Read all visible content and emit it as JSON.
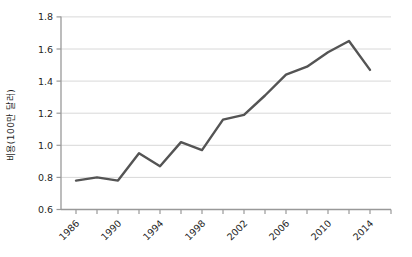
{
  "figure": {
    "background": "#ffffff"
  },
  "chart_data": {
    "type": "line",
    "title": "",
    "xlabel": "",
    "ylabel": "비용(100만 달러)",
    "x": [
      1986,
      1988,
      1990,
      1992,
      1994,
      1996,
      1998,
      2000,
      2002,
      2004,
      2006,
      2008,
      2010,
      2012,
      2014
    ],
    "values": [
      0.78,
      0.8,
      0.78,
      0.95,
      0.87,
      1.02,
      0.97,
      1.16,
      1.19,
      1.31,
      1.44,
      1.49,
      1.58,
      1.65,
      1.47
    ],
    "ylim": [
      0.6,
      1.8
    ],
    "ytick_values": [
      0.6,
      0.8,
      1.0,
      1.2,
      1.4,
      1.6,
      1.8
    ],
    "ytick_labels": [
      "0.6",
      "0.8",
      "1.0",
      "1.2",
      "1.4",
      "1.6",
      "1.8"
    ],
    "xtick_minor_years": [
      1986,
      1988,
      1990,
      1992,
      1994,
      1996,
      1998,
      2000,
      2002,
      2004,
      2006,
      2008,
      2010,
      2012,
      2014,
      2016
    ],
    "xtick_labels": [
      "1986",
      "1990",
      "1994",
      "1998",
      "2002",
      "2006",
      "2010",
      "2014"
    ],
    "xtick_label_years": [
      1986,
      1990,
      1994,
      1998,
      2002,
      2006,
      2010,
      2014
    ],
    "grid": "horizontal",
    "legend": "none",
    "colors": {
      "line": "#545454",
      "grid": "#d8d8d8",
      "axis": "#999999",
      "text": "#1f1f1f"
    }
  }
}
